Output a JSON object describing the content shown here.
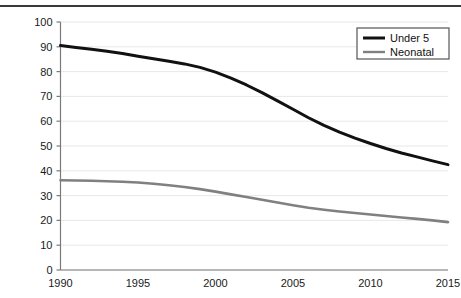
{
  "chart_data": {
    "type": "line",
    "title": "",
    "subtitle": "",
    "xlabel": "",
    "ylabel": "",
    "xlim": [
      1990,
      2015
    ],
    "ylim": [
      0,
      100
    ],
    "ytick_labels": [
      "0",
      "10",
      "20",
      "30",
      "40",
      "50",
      "60",
      "70",
      "80",
      "90",
      "100"
    ],
    "yticks": [
      0,
      10,
      20,
      30,
      40,
      50,
      60,
      70,
      80,
      90,
      100
    ],
    "xtick_labels": [
      "1990",
      "1995",
      "2000",
      "2005",
      "2010",
      "2015"
    ],
    "xticks": [
      1990,
      1995,
      2000,
      2005,
      2010,
      2015
    ],
    "grid": "horizontal",
    "legend_position": "top-right",
    "x": [
      1990,
      1991,
      1992,
      1993,
      1994,
      1995,
      1996,
      1997,
      1998,
      1999,
      2000,
      2001,
      2002,
      2003,
      2004,
      2005,
      2006,
      2007,
      2008,
      2009,
      2010,
      2011,
      2012,
      2013,
      2014,
      2015
    ],
    "series": [
      {
        "name": "Under 5",
        "color": "#111111",
        "values": [
          90.5,
          89.7,
          89.0,
          88.2,
          87.3,
          86.2,
          85.2,
          84.2,
          83.1,
          81.7,
          79.8,
          77.4,
          74.6,
          71.5,
          68.2,
          64.8,
          61.4,
          58.3,
          55.6,
          53.2,
          51.0,
          49.0,
          47.2,
          45.6,
          44.0,
          42.5
        ]
      },
      {
        "name": "Neonatal",
        "color": "#808080",
        "values": [
          36.2,
          36.1,
          36.0,
          35.8,
          35.6,
          35.3,
          34.8,
          34.2,
          33.5,
          32.6,
          31.6,
          30.5,
          29.4,
          28.3,
          27.2,
          26.1,
          25.1,
          24.3,
          23.6,
          23.0,
          22.4,
          21.8,
          21.2,
          20.6,
          20.0,
          19.3
        ]
      }
    ],
    "legend": [
      {
        "label": "Under 5",
        "color": "#111111"
      },
      {
        "label": "Neonatal",
        "color": "#808080"
      }
    ]
  }
}
